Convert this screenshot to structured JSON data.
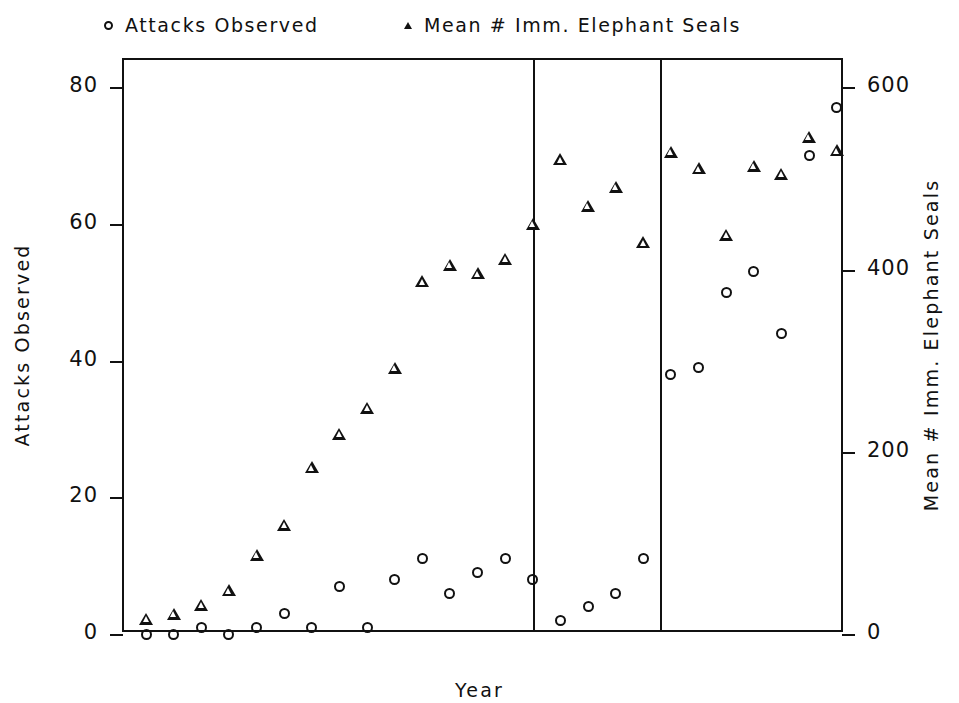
{
  "legend": {
    "entries": [
      {
        "marker": "circle-marker-icon",
        "label": "Attacks Observed"
      },
      {
        "marker": "triangle-marker-icon",
        "label": "Mean # Imm. Elephant Seals"
      }
    ]
  },
  "axes": {
    "x_title": "Year",
    "y_left_title": "Attacks Observed",
    "y_right_title": "Mean # Imm. Elephant Seals",
    "x_ticks": [
      "68",
      "70",
      "72",
      "74",
      "76",
      "78",
      "80",
      "82",
      "84",
      "86",
      "88",
      "90",
      "92"
    ],
    "y_left_ticks": [
      "0",
      "20",
      "40",
      "60",
      "80"
    ],
    "y_right_ticks": [
      "0",
      "200",
      "400",
      "600"
    ]
  },
  "chart_data": {
    "type": "scatter",
    "title": "",
    "xlabel": "Year",
    "ylabel": "Attacks Observed",
    "y2label": "Mean # Imm. Elephant Seals",
    "xlim": [
      67.2,
      93.3
    ],
    "ylim": [
      0,
      84
    ],
    "y2lim": [
      0,
      630
    ],
    "grid": false,
    "legend_position": "top",
    "x": [
      68,
      69,
      70,
      71,
      72,
      73,
      74,
      75,
      76,
      77,
      78,
      79,
      80,
      81,
      82,
      83,
      84,
      85,
      86,
      87,
      88,
      89,
      90,
      91,
      92,
      93
    ],
    "series": [
      {
        "name": "Attacks Observed",
        "axis": "left",
        "marker": "circle",
        "values": [
          0,
          0,
          1,
          0,
          1,
          3,
          1,
          7,
          1,
          8,
          11,
          6,
          9,
          11,
          8,
          2,
          4,
          6,
          11,
          38,
          39,
          50,
          53,
          44,
          70,
          77
        ]
      },
      {
        "name": "Mean # Imm. Elephant Seals",
        "axis": "right",
        "marker": "triangle",
        "values": [
          17,
          22,
          32,
          48,
          87,
          120,
          183,
          220,
          248,
          292,
          387,
          405,
          396,
          412,
          450,
          521,
          470,
          491,
          430,
          529,
          511,
          438,
          514,
          505,
          546,
          531
        ]
      }
    ],
    "reference_lines": [
      {
        "name": "vertical-reference-line-1982",
        "x": 82
      },
      {
        "name": "vertical-reference-line-1986.5",
        "x": 86.6
      }
    ]
  },
  "style": {
    "ink": "#111111",
    "paper": "#ffffff"
  }
}
